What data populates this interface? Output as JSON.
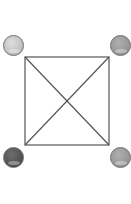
{
  "diagram": {
    "square": {
      "x": 25,
      "y": 57,
      "width": 84,
      "height": 88,
      "stroke": "#555555"
    },
    "nodes": [
      {
        "id": "top-left",
        "cx": 13,
        "cy": 45,
        "color": "#c9c9c9"
      },
      {
        "id": "top-right",
        "cx": 120,
        "cy": 45,
        "color": "#9a9a9a"
      },
      {
        "id": "bottom-left",
        "cx": 13,
        "cy": 157,
        "color": "#555555"
      },
      {
        "id": "bottom-right",
        "cx": 120,
        "cy": 157,
        "color": "#999999"
      }
    ]
  }
}
